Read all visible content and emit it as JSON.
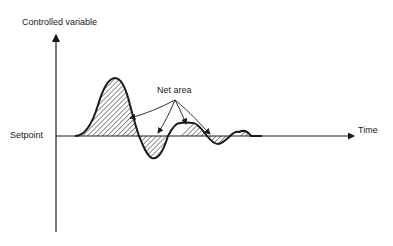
{
  "diagram": {
    "y_axis_label": "Controlled variable",
    "x_axis_label": "Time",
    "setpoint_label": "Setpoint",
    "annotation_label": "Net area",
    "colors": {
      "ink": "#1a1a1a",
      "background": "#ffffff"
    }
  }
}
